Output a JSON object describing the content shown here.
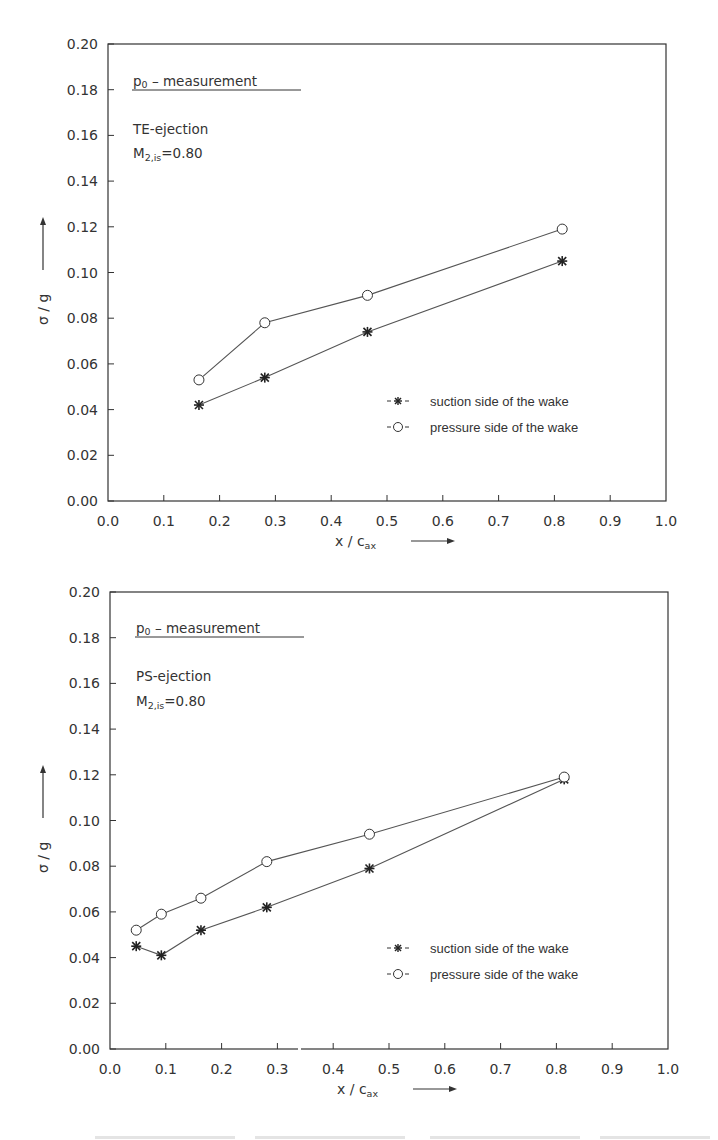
{
  "chart_data": [
    {
      "type": "line",
      "title": "p0 - measurement",
      "annotations": [
        "TE-ejection",
        "M2,is=0.80"
      ],
      "xlabel": "x / c_ax",
      "ylabel": "σ / g",
      "xlim": [
        0.0,
        1.0
      ],
      "ylim": [
        0.0,
        0.2
      ],
      "xticks": [
        "0.0",
        "0.1",
        "0.2",
        "0.3",
        "0.4",
        "0.5",
        "0.6",
        "0.7",
        "0.8",
        "0.9",
        "1.0"
      ],
      "yticks": [
        "0.00",
        "0.02",
        "0.04",
        "0.06",
        "0.08",
        "0.10",
        "0.12",
        "0.14",
        "0.16",
        "0.18",
        "0.20"
      ],
      "grid": false,
      "legend_position": "lower right",
      "series": [
        {
          "name": "suction side of the wake",
          "marker": "asterisk",
          "x": [
            0.163,
            0.281,
            0.465,
            0.814
          ],
          "values": [
            0.042,
            0.054,
            0.074,
            0.105
          ]
        },
        {
          "name": "pressure side of the wake",
          "marker": "open-circle",
          "x": [
            0.163,
            0.281,
            0.465,
            0.814
          ],
          "values": [
            0.053,
            0.078,
            0.09,
            0.119
          ]
        }
      ]
    },
    {
      "type": "line",
      "title": "p0 - measurement",
      "annotations": [
        "PS-ejection",
        "M2,is=0.80"
      ],
      "xlabel": "x / c_ax",
      "ylabel": "σ / g",
      "xlim": [
        0.0,
        1.0
      ],
      "ylim": [
        0.0,
        0.2
      ],
      "xticks": [
        "0.0",
        "0.1",
        "0.2",
        "0.3",
        "0.4",
        "0.5",
        "0.6",
        "0.7",
        "0.8",
        "0.9",
        "1.0"
      ],
      "yticks": [
        "0.00",
        "0.02",
        "0.04",
        "0.06",
        "0.08",
        "0.10",
        "0.12",
        "0.14",
        "0.16",
        "0.18",
        "0.20"
      ],
      "grid": false,
      "legend_position": "lower right",
      "series": [
        {
          "name": "suction side of the wake",
          "marker": "asterisk",
          "x": [
            0.047,
            0.092,
            0.163,
            0.281,
            0.465,
            0.814
          ],
          "values": [
            0.045,
            0.041,
            0.052,
            0.062,
            0.079,
            0.118
          ]
        },
        {
          "name": "pressure side of the wake",
          "marker": "open-circle",
          "x": [
            0.047,
            0.092,
            0.163,
            0.281,
            0.465,
            0.814
          ],
          "values": [
            0.052,
            0.059,
            0.066,
            0.082,
            0.094,
            0.119
          ]
        }
      ]
    }
  ],
  "plots": [
    {
      "title_main": "p",
      "title_sub": "0",
      "title_rest": " – measurement",
      "case": "TE-ejection",
      "mach_main": "M",
      "mach_sub": "2,is",
      "mach_value": "=0.80",
      "ylabel": "σ / g",
      "xlabel_main": "x / c",
      "xlabel_sub": "ax",
      "legend": [
        {
          "symbol": "-✱-",
          "label": "suction side of the wake"
        },
        {
          "symbol": "-○-",
          "label": "pressure side of the wake"
        }
      ]
    },
    {
      "title_main": "p",
      "title_sub": "0",
      "title_rest": " – measurement",
      "case": "PS-ejection",
      "mach_main": "M",
      "mach_sub": "2,is",
      "mach_value": "=0.80",
      "ylabel": "σ / g",
      "xlabel_main": "x / c",
      "xlabel_sub": "ax",
      "legend": [
        {
          "symbol": "-✱-",
          "label": "suction side of the wake"
        },
        {
          "symbol": "-○-",
          "label": "pressure side of the wake"
        }
      ]
    }
  ],
  "colors": {
    "ink": "#333333",
    "line": "#555555",
    "background": "#ffffff"
  }
}
